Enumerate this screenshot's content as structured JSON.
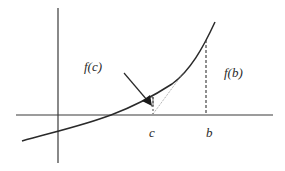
{
  "diagram": {
    "type": "function-graph",
    "labels": {
      "fc": "f(c)",
      "fb": "f(b)",
      "c": "c",
      "b": "b"
    },
    "colors": {
      "line": "#2a2a2a",
      "axis": "#3a3a3a",
      "dashed": "#444444",
      "dotted": "#777777",
      "background": "#ffffff"
    },
    "axes": {
      "x_axis": {
        "x1": 16,
        "y1": 115,
        "x2": 273,
        "y2": 115
      },
      "y_axis": {
        "x1": 58,
        "y1": 8,
        "x2": 58,
        "y2": 163
      }
    },
    "curve_points": [
      [
        22,
        141
      ],
      [
        58,
        131
      ],
      [
        85,
        124
      ],
      [
        111,
        115
      ],
      [
        130,
        107
      ],
      [
        150,
        97
      ],
      [
        165,
        88
      ],
      [
        183,
        73
      ],
      [
        200,
        52
      ],
      [
        206,
        40
      ],
      [
        215,
        22
      ]
    ],
    "points": {
      "c": {
        "x": 153,
        "y_axis": 115,
        "y_curve": 97
      },
      "b": {
        "x": 206,
        "y_axis": 115,
        "y_curve": 40
      },
      "secant_end": {
        "x": 184,
        "y": 72
      }
    },
    "arrow": {
      "from": [
        124,
        73
      ],
      "to": [
        152,
        104
      ]
    }
  }
}
